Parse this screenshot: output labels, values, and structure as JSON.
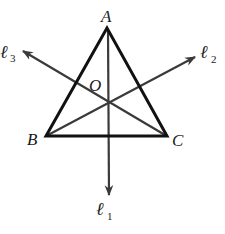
{
  "diagram": {
    "type": "triangle-with-concurrent-lines",
    "colors": {
      "triangle": "#111111",
      "lines": "#3a3a3a",
      "text": "#1a1a1a",
      "background": "#ffffff"
    },
    "vertices": {
      "A": {
        "label": "A",
        "x": 107,
        "y": 28
      },
      "B": {
        "label": "B",
        "x": 46,
        "y": 136
      },
      "C": {
        "label": "C",
        "x": 167,
        "y": 136
      }
    },
    "center": {
      "label": "O",
      "x": 109,
      "y": 102
    },
    "lines": [
      {
        "name": "l1",
        "script": "ℓ",
        "subscript": "1",
        "direction": "down"
      },
      {
        "name": "l2",
        "script": "ℓ",
        "subscript": "2",
        "direction": "upper-right"
      },
      {
        "name": "l3",
        "script": "ℓ",
        "subscript": "3",
        "direction": "upper-left"
      }
    ]
  }
}
